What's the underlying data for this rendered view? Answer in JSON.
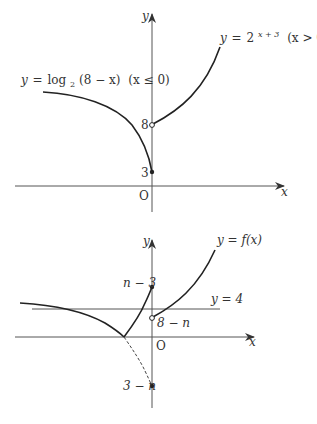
{
  "diagram": {
    "top_graph": {
      "axis_x_label": "x",
      "axis_y_label": "y",
      "origin_label": "O",
      "curve_left": {
        "equation_lhs": "y",
        "eq": "=",
        "func": "log",
        "base": "2",
        "arg": "(8 − x)",
        "domain": "(x ≤ 0)"
      },
      "curve_right": {
        "equation_lhs": "y",
        "eq": "=",
        "base": "2",
        "exponent": "x + 3",
        "domain": "(x > 0)"
      },
      "point_open_label": "8",
      "point_filled_label": "3"
    },
    "bottom_graph": {
      "axis_x_label": "x",
      "axis_y_label": "y",
      "origin_label": "O",
      "curve_label": "y = f(x)",
      "line_label": "y = 4",
      "point_top_label": "n − 3",
      "point_open_label": "8 − n",
      "point_bottom_label": "3 − n"
    },
    "colors": {
      "curve": "#222222",
      "axis": "#555555",
      "text": "#333333"
    }
  }
}
